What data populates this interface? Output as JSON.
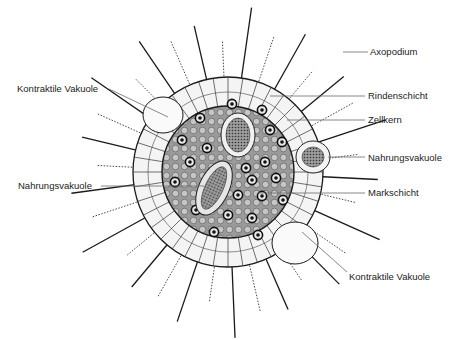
{
  "figure": {
    "colors": {
      "ink": "#1a1a1a",
      "medulla_fill": "#8f8f8f",
      "cortex_fill": "#f4f4f4",
      "leader_line": "#6a6a6a",
      "label_text": "#222222"
    }
  },
  "labels": {
    "axopodium": "Axopodium",
    "rindenschicht": "Rindenschicht",
    "zellkern": "Zellkern",
    "nahrungsvakuole_right": "Nahrungsvakuole",
    "markschicht": "Markschicht",
    "kontraktile_vakuole_bottom": "Kontraktile Vakuole",
    "kontraktile_vakuole_top": "Kontraktile Vakuole",
    "nahrungsvakuole_left": "Nahrungsvakuole"
  }
}
